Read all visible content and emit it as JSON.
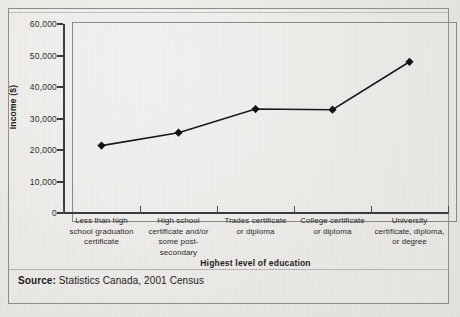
{
  "figure": {
    "source_label": "Source:",
    "source_text": "Statistics Canada, 2001 Census"
  },
  "chart_data": {
    "type": "line",
    "title": "",
    "xlabel": "Highest level of education",
    "ylabel": "Income ($)",
    "categories": [
      "Less than high school graduation certificate",
      "High school certificate and/or some post-secondary",
      "Trades certificate or diploma",
      "College certificate or diploma",
      "University certificate, diploma, or degree"
    ],
    "category_lines": [
      [
        "Less than high",
        "school graduation",
        "certificate"
      ],
      [
        "High school",
        "certificate and/or",
        "some post-secondary"
      ],
      [
        "Trades certificate",
        "or diploma"
      ],
      [
        "College certificate",
        "or diploma"
      ],
      [
        "University",
        "certificate, diploma,",
        "or degree"
      ]
    ],
    "values": [
      21400,
      25500,
      33000,
      32800,
      48000
    ],
    "ylim": [
      0,
      60000
    ],
    "yticks": [
      0,
      10000,
      20000,
      30000,
      40000,
      50000,
      60000
    ],
    "ytick_labels": [
      "0",
      "10,000",
      "20,000",
      "30,000",
      "40,000",
      "50,000",
      "60,000"
    ],
    "grid": false,
    "legend": "none",
    "marker": "diamond",
    "line_color": "#1a1a1a",
    "marker_color": "#111111"
  }
}
